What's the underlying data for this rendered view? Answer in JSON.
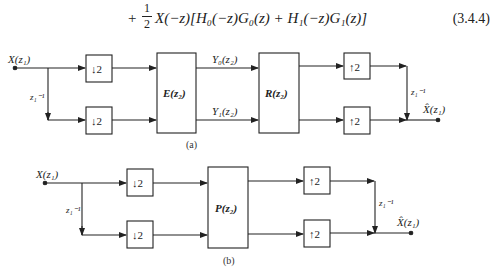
{
  "equation": {
    "plus": "+",
    "frac_num": "1",
    "frac_den": "2",
    "body": "X(−z)[H₀(−z)G₀(z) + H₁(−z)G₁(z)]",
    "number": "(3.4.4)"
  },
  "diagram_a": {
    "input_label": "X(z₁)",
    "delay_in_label": "z₁⁻¹",
    "down_top": "↓2",
    "down_bottom": "↓2",
    "block_e": "E(z₂)",
    "signal_top": "Y₀(z₂)",
    "signal_bottom": "Y₁(z₂)",
    "block_r": "R(z₂)",
    "up_top": "↑2",
    "up_bottom": "↑2",
    "delay_out_label": "z₁⁻¹",
    "output_label": "X̂(z₁)",
    "caption": "(a)"
  },
  "diagram_b": {
    "input_label": "X(z₁)",
    "delay_in_label": "z₁⁻¹",
    "down_top": "↓2",
    "down_bottom": "↓2",
    "block_p": "P(z₂)",
    "up_top": "↑2",
    "up_bottom": "↑2",
    "delay_out_label": "z₁⁻¹",
    "output_label": "X̂(z₁)",
    "caption": "(b)"
  }
}
